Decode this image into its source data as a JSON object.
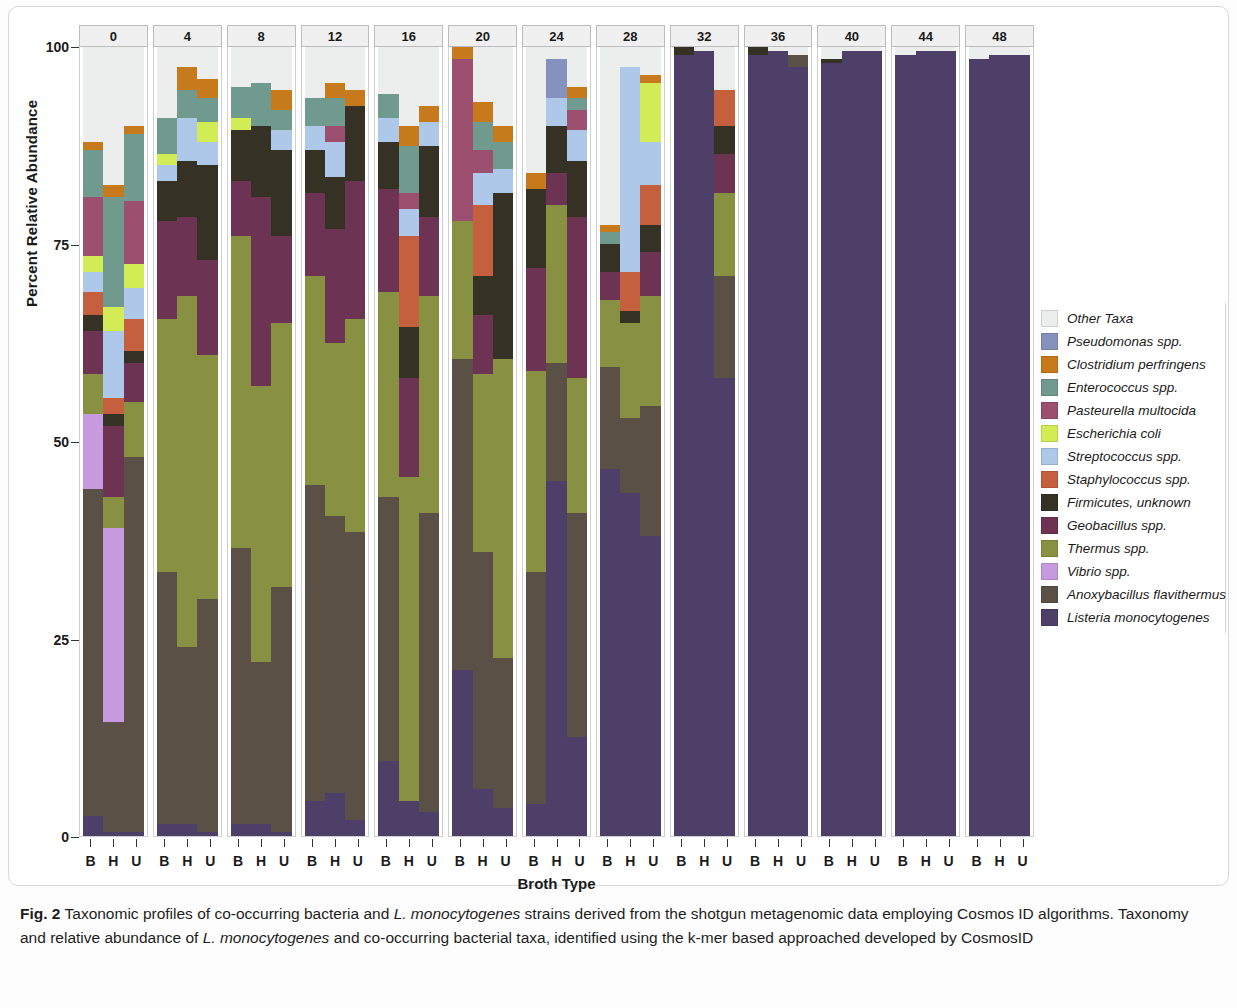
{
  "figure": {
    "label": "Fig. 2",
    "caption_part1": "Taxonomic profiles of co-occurring bacteria and ",
    "caption_italic1": "L. monocytogenes",
    "caption_part2": " strains derived from the shotgun metagenomic data employing Cosmos ID algorithms. Taxonomy and relative abundance of ",
    "caption_italic2": "L. monocytogenes",
    "caption_part3": " and co-occurring bacterial taxa, identified using the k-mer based approached developed by CosmosID"
  },
  "axes": {
    "ylabel": "Percent Relative Abundance",
    "xlabel": "Broth Type",
    "yticks": [
      "0",
      "25",
      "50",
      "75",
      "100"
    ],
    "xticks": [
      "B",
      "H",
      "U"
    ]
  },
  "legend": {
    "entries": [
      {
        "label": "Other Taxa",
        "color": "#eceeed"
      },
      {
        "label": "Pseudomonas spp.",
        "color": "#8492bd"
      },
      {
        "label": "Clostridium perfringens",
        "color": "#c77a1b"
      },
      {
        "label": "Enterococcus spp.",
        "color": "#6f9a8d"
      },
      {
        "label": "Pasteurella multocida",
        "color": "#9c4f6e"
      },
      {
        "label": "Escherichia coli",
        "color": "#d2ec55"
      },
      {
        "label": "Streptococcus spp.",
        "color": "#adc8e8"
      },
      {
        "label": "Staphylococcus spp.",
        "color": "#c5603f"
      },
      {
        "label": "Firmicutes, unknown",
        "color": "#353225"
      },
      {
        "label": "Geobacillus spp.",
        "color": "#6d3352"
      },
      {
        "label": "Thermus spp.",
        "color": "#889141"
      },
      {
        "label": "Vibrio spp.",
        "color": "#c59ade"
      },
      {
        "label": "Anoxybacillus flavithermus",
        "color": "#5a5046"
      },
      {
        "label": "Listeria monocytogenes",
        "color": "#4e3f68"
      }
    ]
  },
  "chart_data": {
    "type": "bar",
    "subtype": "stacked-percent faceted",
    "title": "",
    "xlabel": "Broth Type",
    "ylabel": "Percent Relative Abundance",
    "ylim": [
      0,
      100
    ],
    "grid": false,
    "legend_position": "right",
    "facet_variable": "Enrichment time (h)",
    "facets": [
      "0",
      "4",
      "8",
      "12",
      "16",
      "20",
      "24",
      "28",
      "32",
      "36",
      "40",
      "44",
      "48"
    ],
    "categories": [
      "B",
      "H",
      "U"
    ],
    "taxa_order_bottom_to_top": [
      "Listeria monocytogenes",
      "Anoxybacillus flavithermus",
      "Vibrio spp.",
      "Thermus spp.",
      "Geobacillus spp.",
      "Firmicutes, unknown",
      "Staphylococcus spp.",
      "Streptococcus spp.",
      "Escherichia coli",
      "Pasteurella multocida",
      "Enterococcus spp.",
      "Clostridium perfringens",
      "Pseudomonas spp.",
      "Other Taxa"
    ],
    "panels": [
      {
        "facet": "0",
        "bars": [
          {
            "cat": "B",
            "values": [
              2.5,
              41.5,
              9.5,
              5.0,
              5.5,
              2.0,
              3.0,
              2.5,
              2.0,
              7.5,
              6.0,
              1.0,
              0.0,
              12.0
            ]
          },
          {
            "cat": "H",
            "values": [
              0.5,
              14.0,
              24.5,
              4.0,
              9.0,
              1.5,
              2.0,
              8.5,
              3.0,
              0.0,
              14.0,
              1.5,
              0.0,
              17.5
            ]
          },
          {
            "cat": "U",
            "values": [
              0.5,
              47.5,
              0.0,
              7.0,
              5.0,
              1.5,
              4.0,
              4.0,
              3.0,
              8.0,
              8.5,
              1.0,
              0.0,
              10.0
            ]
          }
        ]
      },
      {
        "facet": "4",
        "bars": [
          {
            "cat": "B",
            "values": [
              1.5,
              32.0,
              0.0,
              32.0,
              12.5,
              5.0,
              0.0,
              2.0,
              1.5,
              0.0,
              4.5,
              0.0,
              0.0,
              9.0
            ]
          },
          {
            "cat": "H",
            "values": [
              1.5,
              22.5,
              0.0,
              44.5,
              10.0,
              7.0,
              0.0,
              5.5,
              0.0,
              0.0,
              3.5,
              3.0,
              0.0,
              2.5
            ]
          },
          {
            "cat": "U",
            "values": [
              0.5,
              29.5,
              0.0,
              31.0,
              12.0,
              12.0,
              0.0,
              3.0,
              2.5,
              0.0,
              3.0,
              2.5,
              0.0,
              4.0
            ]
          }
        ]
      },
      {
        "facet": "8",
        "bars": [
          {
            "cat": "B",
            "values": [
              1.5,
              35.0,
              0.0,
              39.5,
              7.0,
              6.5,
              0.0,
              0.0,
              1.5,
              0.0,
              4.0,
              0.0,
              0.0,
              5.0
            ]
          },
          {
            "cat": "H",
            "values": [
              1.5,
              20.5,
              0.0,
              35.0,
              24.0,
              9.0,
              0.0,
              0.0,
              0.0,
              0.0,
              5.5,
              0.0,
              0.0,
              4.5
            ]
          },
          {
            "cat": "U",
            "values": [
              0.5,
              31.0,
              0.0,
              33.5,
              11.0,
              11.0,
              0.0,
              2.5,
              0.0,
              0.0,
              2.5,
              2.5,
              0.0,
              5.5
            ]
          }
        ]
      },
      {
        "facet": "12",
        "bars": [
          {
            "cat": "B",
            "values": [
              4.5,
              40.0,
              0.0,
              26.5,
              10.5,
              5.5,
              0.0,
              3.0,
              0.0,
              0.0,
              3.5,
              0.0,
              0.0,
              6.5
            ]
          },
          {
            "cat": "H",
            "values": [
              5.5,
              35.0,
              0.0,
              22.0,
              14.5,
              6.5,
              0.0,
              4.5,
              0.0,
              2.0,
              3.5,
              2.0,
              0.0,
              4.5
            ]
          },
          {
            "cat": "U",
            "values": [
              2.0,
              36.5,
              0.0,
              27.0,
              17.5,
              9.5,
              0.0,
              0.0,
              0.0,
              0.0,
              0.0,
              2.0,
              0.0,
              5.5
            ]
          }
        ]
      },
      {
        "facet": "16",
        "bars": [
          {
            "cat": "B",
            "values": [
              9.5,
              33.5,
              0.0,
              26.0,
              13.0,
              6.0,
              0.0,
              3.0,
              0.0,
              0.0,
              3.0,
              0.0,
              0.0,
              6.0
            ]
          },
          {
            "cat": "H",
            "values": [
              4.5,
              0.0,
              0.0,
              41.0,
              12.5,
              6.5,
              11.5,
              3.5,
              0.0,
              2.0,
              6.0,
              2.5,
              0.0,
              10.0
            ]
          },
          {
            "cat": "U",
            "values": [
              3.0,
              38.0,
              0.0,
              27.5,
              10.0,
              9.0,
              0.0,
              3.0,
              0.0,
              0.0,
              0.0,
              2.0,
              0.0,
              7.5
            ]
          }
        ]
      },
      {
        "facet": "20",
        "bars": [
          {
            "cat": "B",
            "values": [
              21.0,
              39.5,
              0.0,
              17.5,
              0.0,
              0.0,
              0.0,
              0.0,
              0.0,
              20.5,
              0.0,
              1.5,
              0.0,
              0.0
            ]
          },
          {
            "cat": "H",
            "values": [
              6.0,
              30.0,
              0.0,
              22.5,
              7.5,
              5.0,
              9.0,
              4.0,
              0.0,
              3.0,
              3.5,
              2.5,
              0.0,
              7.0
            ]
          },
          {
            "cat": "U",
            "values": [
              3.5,
              19.0,
              0.0,
              38.0,
              0.0,
              21.0,
              0.0,
              3.0,
              0.0,
              0.0,
              3.5,
              2.0,
              0.0,
              10.0
            ]
          }
        ]
      },
      {
        "facet": "24",
        "bars": [
          {
            "cat": "B",
            "values": [
              4.0,
              29.5,
              0.0,
              25.5,
              13.0,
              10.0,
              0.0,
              0.0,
              0.0,
              0.0,
              0.0,
              2.0,
              0.0,
              16.0
            ]
          },
          {
            "cat": "H",
            "values": [
              45.0,
              15.0,
              0.0,
              20.0,
              4.0,
              6.0,
              0.0,
              3.5,
              0.0,
              0.0,
              0.0,
              0.0,
              5.0,
              1.5
            ]
          },
          {
            "cat": "U",
            "values": [
              12.5,
              28.5,
              0.0,
              17.0,
              20.5,
              7.0,
              0.0,
              4.0,
              0.0,
              2.5,
              1.5,
              1.5,
              0.0,
              5.0
            ]
          }
        ]
      },
      {
        "facet": "28",
        "bars": [
          {
            "cat": "B",
            "values": [
              46.5,
              13.0,
              0.0,
              8.5,
              3.5,
              3.5,
              0.0,
              0.0,
              0.0,
              0.0,
              1.5,
              1.0,
              0.0,
              22.5
            ]
          },
          {
            "cat": "H",
            "values": [
              43.5,
              9.5,
              0.0,
              12.0,
              0.0,
              1.5,
              5.0,
              26.0,
              0.0,
              0.0,
              0.0,
              0.0,
              0.0,
              2.5
            ]
          },
          {
            "cat": "U",
            "values": [
              38.0,
              16.5,
              0.0,
              14.0,
              5.5,
              3.5,
              5.0,
              5.5,
              7.5,
              0.0,
              0.0,
              1.0,
              0.0,
              3.5
            ]
          }
        ]
      },
      {
        "facet": "32",
        "bars": [
          {
            "cat": "B",
            "values": [
              99.0,
              0.0,
              0.0,
              0.0,
              0.0,
              1.0,
              0.0,
              0.0,
              0.0,
              0.0,
              0.0,
              0.0,
              0.0,
              0.0
            ]
          },
          {
            "cat": "H",
            "values": [
              99.5,
              0.0,
              0.0,
              0.0,
              0.0,
              0.0,
              0.0,
              0.0,
              0.0,
              0.0,
              0.0,
              0.0,
              0.0,
              0.5
            ]
          },
          {
            "cat": "U",
            "values": [
              58.0,
              13.0,
              0.0,
              10.5,
              5.0,
              3.5,
              4.5,
              0.0,
              0.0,
              0.0,
              0.0,
              0.0,
              0.0,
              5.5
            ]
          }
        ]
      },
      {
        "facet": "36",
        "bars": [
          {
            "cat": "B",
            "values": [
              99.0,
              0.0,
              0.0,
              0.0,
              0.0,
              1.0,
              0.0,
              0.0,
              0.0,
              0.0,
              0.0,
              0.0,
              0.0,
              0.0
            ]
          },
          {
            "cat": "H",
            "values": [
              99.5,
              0.0,
              0.0,
              0.0,
              0.0,
              0.0,
              0.0,
              0.0,
              0.0,
              0.0,
              0.0,
              0.0,
              0.0,
              0.5
            ]
          },
          {
            "cat": "U",
            "values": [
              97.5,
              1.5,
              0.0,
              0.0,
              0.0,
              0.0,
              0.0,
              0.0,
              0.0,
              0.0,
              0.0,
              0.0,
              0.0,
              1.0
            ]
          }
        ]
      },
      {
        "facet": "40",
        "bars": [
          {
            "cat": "B",
            "values": [
              98.0,
              0.0,
              0.0,
              0.0,
              0.0,
              0.5,
              0.0,
              0.0,
              0.0,
              0.0,
              0.0,
              0.0,
              0.0,
              1.5
            ]
          },
          {
            "cat": "H",
            "values": [
              99.5,
              0.0,
              0.0,
              0.0,
              0.0,
              0.0,
              0.0,
              0.0,
              0.0,
              0.0,
              0.0,
              0.0,
              0.0,
              0.5
            ]
          },
          {
            "cat": "U",
            "values": [
              99.5,
              0.0,
              0.0,
              0.0,
              0.0,
              0.0,
              0.0,
              0.0,
              0.0,
              0.0,
              0.0,
              0.0,
              0.0,
              0.5
            ]
          }
        ]
      },
      {
        "facet": "44",
        "bars": [
          {
            "cat": "B",
            "values": [
              99.0,
              0.0,
              0.0,
              0.0,
              0.0,
              0.0,
              0.0,
              0.0,
              0.0,
              0.0,
              0.0,
              0.0,
              0.0,
              1.0
            ]
          },
          {
            "cat": "H",
            "values": [
              99.5,
              0.0,
              0.0,
              0.0,
              0.0,
              0.0,
              0.0,
              0.0,
              0.0,
              0.0,
              0.0,
              0.0,
              0.0,
              0.5
            ]
          },
          {
            "cat": "U",
            "values": [
              99.5,
              0.0,
              0.0,
              0.0,
              0.0,
              0.0,
              0.0,
              0.0,
              0.0,
              0.0,
              0.0,
              0.0,
              0.0,
              0.5
            ]
          }
        ]
      },
      {
        "facet": "48",
        "bars": [
          {
            "cat": "B",
            "values": [
              98.5,
              0.0,
              0.0,
              0.0,
              0.0,
              0.0,
              0.0,
              0.0,
              0.0,
              0.0,
              0.0,
              0.0,
              0.0,
              1.5
            ]
          },
          {
            "cat": "H",
            "values": [
              99.0,
              0.0,
              0.0,
              0.0,
              0.0,
              0.0,
              0.0,
              0.0,
              0.0,
              0.0,
              0.0,
              0.0,
              0.0,
              1.0
            ]
          },
          {
            "cat": "U",
            "values": [
              99.0,
              0.0,
              0.0,
              0.0,
              0.0,
              0.0,
              0.0,
              0.0,
              0.0,
              0.0,
              0.0,
              0.0,
              0.0,
              1.0
            ]
          }
        ]
      }
    ]
  }
}
